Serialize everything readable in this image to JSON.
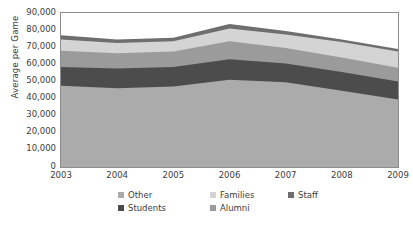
{
  "chart_data": {
    "type": "area",
    "stacked": true,
    "title": "",
    "xlabel": "",
    "ylabel": "Average per Game",
    "categories": [
      "2003",
      "2004",
      "2005",
      "2006",
      "2007",
      "2008",
      "2009"
    ],
    "x": [
      2003,
      2004,
      2005,
      2006,
      2007,
      2008,
      2009
    ],
    "ylim": [
      0,
      90000
    ],
    "ytick_labels": [
      "0",
      "10,000",
      "20,000",
      "30,000",
      "40,000",
      "50,000",
      "60,000",
      "70,000",
      "80,000",
      "90,000"
    ],
    "ytick_values": [
      0,
      10000,
      20000,
      30000,
      40000,
      50000,
      60000,
      70000,
      80000,
      90000
    ],
    "grid": false,
    "legend_position": "bottom",
    "stack_order_bottom_to_top": [
      "Other",
      "Students",
      "Alumni",
      "Families",
      "Staff"
    ],
    "series": [
      {
        "name": "Other",
        "color": "#ababab",
        "values": [
          47500,
          46000,
          47000,
          51000,
          49500,
          44500,
          39500
        ]
      },
      {
        "name": "Students",
        "color": "#4c4c4c",
        "values": [
          11000,
          11500,
          11500,
          12000,
          11000,
          11000,
          10500
        ]
      },
      {
        "name": "Alumni",
        "color": "#9b9b9b",
        "values": [
          9500,
          9000,
          9000,
          10500,
          9000,
          8500,
          8000
        ]
      },
      {
        "name": "Families",
        "color": "#d4d4d4",
        "values": [
          6500,
          6000,
          6000,
          7500,
          8000,
          9000,
          9500
        ]
      },
      {
        "name": "Staff",
        "color": "#6e6e6e",
        "values": [
          2500,
          2000,
          2000,
          2500,
          2000,
          1500,
          1500
        ]
      }
    ],
    "cumulative_tops": {
      "Other": [
        47500,
        46000,
        47000,
        51000,
        49500,
        44500,
        39500
      ],
      "Students": [
        58500,
        57500,
        58500,
        63000,
        60500,
        55500,
        50000
      ],
      "Alumni": [
        68000,
        66500,
        67500,
        73500,
        69500,
        64000,
        58000
      ],
      "Families": [
        74500,
        72500,
        73500,
        81000,
        77500,
        73000,
        67500
      ],
      "Staff": [
        77000,
        74500,
        75500,
        83500,
        79500,
        74500,
        69000
      ]
    },
    "background_color": "#ffffff",
    "axis_color": "#8d8d8d"
  },
  "axes": {
    "y_title": "Average per Game"
  },
  "legend": {
    "items": [
      {
        "label": "Other",
        "color": "#ababab"
      },
      {
        "label": "Families",
        "color": "#d4d4d4"
      },
      {
        "label": "Staff",
        "color": "#6e6e6e"
      },
      {
        "label": "Students",
        "color": "#4c4c4c"
      },
      {
        "label": "Alumni",
        "color": "#9b9b9b"
      }
    ]
  }
}
